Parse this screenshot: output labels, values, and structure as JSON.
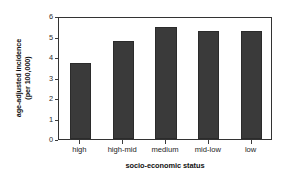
{
  "chart_data": {
    "type": "bar",
    "title": "",
    "subtitle": "",
    "xlabel": "socio-economic status",
    "ylabel_line1": "age-adjusted incidence",
    "ylabel_line2": "(per 100,000)",
    "categories": [
      "high",
      "high-mid",
      "medium",
      "mid-low",
      "low"
    ],
    "values": [
      3.7,
      4.8,
      5.45,
      5.28,
      5.25
    ],
    "series": [
      {
        "name": "age-adjusted incidence (per 100,000)",
        "values": [
          3.7,
          4.8,
          5.45,
          5.28,
          5.25
        ]
      }
    ],
    "ylim": [
      0,
      6
    ],
    "ytick_labels": [
      "0",
      "1",
      "2",
      "3",
      "4",
      "5",
      "6"
    ],
    "ytick_values": [
      0,
      1,
      2,
      3,
      4,
      5,
      6
    ],
    "grid": false,
    "legend": false,
    "legend_position": "none",
    "bar_color": "#3a3a3a",
    "frame_color": "#333333",
    "background_color": "#ffffff",
    "annotations": []
  }
}
